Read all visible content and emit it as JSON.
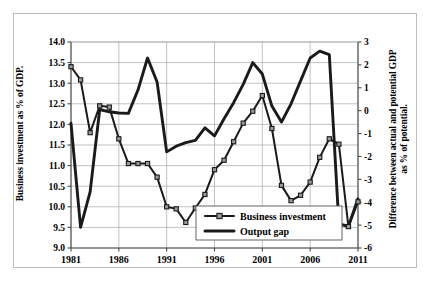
{
  "chart_data": {
    "type": "line",
    "title": "",
    "xlabel": "",
    "ylabel": "Business investment as % of GDP.",
    "y2label_line1": "Difference between actual and potential GDP",
    "y2label_line2": "as % of potential.",
    "x": [
      1981,
      1982,
      1983,
      1984,
      1985,
      1986,
      1987,
      1988,
      1989,
      1990,
      1991,
      1992,
      1993,
      1994,
      1995,
      1996,
      1997,
      1998,
      1999,
      2000,
      2001,
      2002,
      2003,
      2004,
      2005,
      2006,
      2007,
      2008,
      2009,
      2010,
      2011
    ],
    "xticks": [
      "1981",
      "1986",
      "1991",
      "1996",
      "2001",
      "2006",
      "2011"
    ],
    "xtick_values": [
      1981,
      1986,
      1991,
      1996,
      2001,
      2006,
      2011
    ],
    "xlim": [
      1981,
      2011
    ],
    "ylim": [
      9.0,
      14.0
    ],
    "yticks": [
      "9.0",
      "9.5",
      "10.0",
      "10.5",
      "11.0",
      "11.5",
      "12.0",
      "12.5",
      "13.0",
      "13.5",
      "14.0"
    ],
    "ytick_values": [
      9.0,
      9.5,
      10.0,
      10.5,
      11.0,
      11.5,
      12.0,
      12.5,
      13.0,
      13.5,
      14.0
    ],
    "y2lim": [
      -6,
      3
    ],
    "y2ticks": [
      "-6",
      "-5",
      "-4",
      "-3",
      "-2",
      "-1",
      "0",
      "1",
      "2",
      "3"
    ],
    "y2tick_values": [
      -6,
      -5,
      -4,
      -3,
      -2,
      -1,
      0,
      1,
      2,
      3
    ],
    "grid": true,
    "legend_position": "bottom-center",
    "series": [
      {
        "name": "Business investment",
        "axis": "left",
        "marker": "square",
        "color": "#1a1a1a",
        "marker_fill": "#9a9a9a",
        "values": [
          13.4,
          13.08,
          11.8,
          12.45,
          12.42,
          11.65,
          11.05,
          11.05,
          11.05,
          10.72,
          10.0,
          9.95,
          9.62,
          9.97,
          10.3,
          10.9,
          11.13,
          11.58,
          12.03,
          12.32,
          12.7,
          11.9,
          10.52,
          10.15,
          10.28,
          10.6,
          11.2,
          11.65,
          11.52,
          9.52,
          10.12
        ]
      },
      {
        "name": "Output gap",
        "axis": "right",
        "marker": "none",
        "color": "#1a1a1a",
        "values": [
          -0.55,
          -5.1,
          -3.55,
          0.05,
          -0.05,
          -0.1,
          -0.12,
          0.9,
          2.3,
          1.25,
          -1.8,
          -1.55,
          -1.4,
          -1.3,
          -0.75,
          -1.1,
          -0.35,
          0.35,
          1.15,
          2.1,
          1.6,
          0.2,
          -0.5,
          0.3,
          1.3,
          2.3,
          2.6,
          2.45,
          -4.95,
          -5.05,
          -3.85
        ]
      }
    ]
  },
  "legend": {
    "items": [
      {
        "label": "Business investment",
        "style": "line-marker"
      },
      {
        "label": "Output gap",
        "style": "line-thick"
      }
    ]
  },
  "colors": {
    "line": "#1a1a1a",
    "marker_fill": "#9a9a9a",
    "grid": "#a8a8a8",
    "axis": "#4a4a4a",
    "frame": "#bdbdbd",
    "background": "#ffffff"
  }
}
